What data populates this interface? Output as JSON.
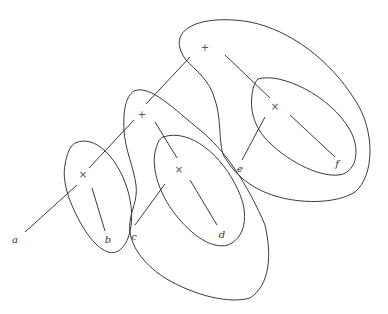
{
  "diagram": {
    "type": "nested-cluster-tree",
    "stroke_color": "#3a3a3a",
    "background": "#ffffff",
    "internal_nodes": [
      {
        "id": "root",
        "symbol": "+",
        "x": 205,
        "y": 48
      },
      {
        "id": "mid",
        "symbol": "+",
        "x": 142,
        "y": 115
      },
      {
        "id": "left-pair",
        "symbol": "×",
        "x": 83,
        "y": 175
      },
      {
        "id": "cd-pair",
        "symbol": "×",
        "x": 179,
        "y": 170
      },
      {
        "id": "ef-pair",
        "symbol": "×",
        "x": 275,
        "y": 107
      }
    ],
    "leaves": [
      {
        "id": "a",
        "label": "a",
        "x": 15,
        "y": 240
      },
      {
        "id": "b",
        "label": "b",
        "x": 108,
        "y": 240
      },
      {
        "id": "c",
        "label": "c",
        "x": 134,
        "y": 237
      },
      {
        "id": "d",
        "label": "d",
        "x": 222,
        "y": 235
      },
      {
        "id": "e",
        "label": "e",
        "x": 240,
        "y": 169
      },
      {
        "id": "f",
        "label": "f",
        "x": 337,
        "y": 164
      }
    ],
    "edges": [
      {
        "from": "root",
        "to": "mid"
      },
      {
        "from": "root",
        "to": "ef-pair"
      },
      {
        "from": "mid",
        "to": "left-pair"
      },
      {
        "from": "mid",
        "to": "cd-pair"
      },
      {
        "from": "left-pair",
        "to": "a"
      },
      {
        "from": "left-pair",
        "to": "b"
      },
      {
        "from": "cd-pair",
        "to": "c"
      },
      {
        "from": "cd-pair",
        "to": "d"
      },
      {
        "from": "ef-pair",
        "to": "e"
      },
      {
        "from": "ef-pair",
        "to": "f"
      }
    ],
    "clusters": [
      {
        "id": "cluster-ab",
        "contains": [
          "a",
          "b"
        ]
      },
      {
        "id": "cluster-cd",
        "contains": [
          "c",
          "d"
        ]
      },
      {
        "id": "cluster-ef",
        "contains": [
          "e",
          "f"
        ]
      },
      {
        "id": "cluster-mid",
        "contains": [
          "c",
          "d"
        ]
      },
      {
        "id": "cluster-root",
        "contains": [
          "e",
          "f"
        ]
      }
    ]
  }
}
